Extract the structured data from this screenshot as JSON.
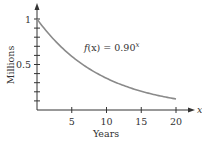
{
  "chart_data": {
    "type": "line",
    "title": "",
    "xlabel": "Years",
    "ylabel": "Millions",
    "x_axis_symbol": "x",
    "xlim": [
      0,
      20
    ],
    "ylim": [
      0,
      1
    ],
    "xticks": [
      5,
      10,
      15,
      20
    ],
    "xtick_labels": [
      "5",
      "10",
      "15",
      "20"
    ],
    "yticks_minor": [
      0.1,
      0.2,
      0.3,
      0.4,
      0.5,
      0.6,
      0.7,
      0.8,
      0.9,
      1.0
    ],
    "ytick_labels": [
      {
        "value": 1,
        "label": "1"
      },
      {
        "value": 0.5,
        "label": "0.5"
      }
    ],
    "grid": false,
    "legend": null,
    "annotation": {
      "text_prefix": "f(x) = 0.90",
      "superscript": "x",
      "position": {
        "x": 6.8,
        "y": 0.66
      }
    },
    "series": [
      {
        "name": "f(x) = 0.90^x",
        "color": "#8a8a8a",
        "x": [
          0,
          2,
          4,
          6,
          8,
          10,
          12,
          14,
          16,
          18,
          20
        ],
        "y": [
          1.0,
          0.81,
          0.6561,
          0.5314,
          0.4305,
          0.3487,
          0.2824,
          0.2288,
          0.1853,
          0.1501,
          0.1216
        ]
      }
    ]
  }
}
